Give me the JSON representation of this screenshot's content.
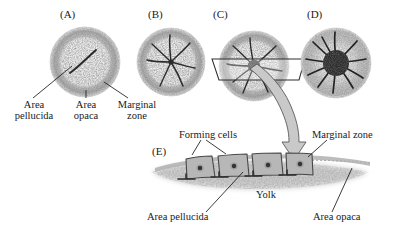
{
  "figure": {
    "type": "biological-diagram"
  },
  "panels": [
    {
      "id": "A",
      "tag": "(A)"
    },
    {
      "id": "B",
      "tag": "(B)"
    },
    {
      "id": "C",
      "tag": "(C)"
    },
    {
      "id": "D",
      "tag": "(D)"
    },
    {
      "id": "E",
      "tag": "(E)"
    }
  ],
  "top_labels": [
    {
      "name": "area-pellucida",
      "line1": "Area",
      "line2": "pellucida"
    },
    {
      "name": "area-opaca",
      "line1": "Area",
      "line2": "opaca"
    },
    {
      "name": "marginal-zone",
      "line1": "Marginal",
      "line2": "zone"
    }
  ],
  "bottom_labels": [
    {
      "name": "forming-cells",
      "text": "Forming cells"
    },
    {
      "name": "marginal-zone",
      "text": "Marginal zone"
    },
    {
      "name": "yolk",
      "text": "Yolk"
    },
    {
      "name": "area-pellucida",
      "text": "Area pellucida"
    },
    {
      "name": "area-opaca",
      "text": "Area opaca"
    }
  ],
  "colors": {
    "ink": "#1a1a1a",
    "area_pellucida": "#ebebeb",
    "area_opaca": "#b9b9b9",
    "cell_fill": "#b5b5b5",
    "cell_stroke": "#4a4a4a",
    "nucleus": "#3a3a3a",
    "arrow_fill": "#c8c8c8",
    "arrow_stroke": "#555555",
    "yolk": "#cfcfcf"
  },
  "cells": [
    {
      "name": "forming-cell-1"
    },
    {
      "name": "forming-cell-2"
    },
    {
      "name": "forming-cell-3"
    },
    {
      "name": "forming-cell-4"
    }
  ]
}
